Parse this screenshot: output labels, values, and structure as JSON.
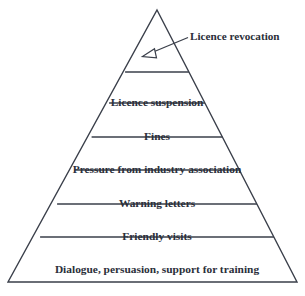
{
  "diagram": {
    "type": "enforcement-pyramid",
    "apex_callout": {
      "label": "Licence revocation",
      "icon": "arrow-icon",
      "arrow_style": "hollow-triangle-head",
      "points_to": "pyramid-apex"
    },
    "levels": [
      {
        "rank": 1,
        "label": "",
        "note": "apex band (unlabelled, target of callout)"
      },
      {
        "rank": 2,
        "label": "Licence suspension"
      },
      {
        "rank": 3,
        "label": "Fines"
      },
      {
        "rank": 4,
        "label": "Pressure from industry association"
      },
      {
        "rank": 5,
        "label": "Warning letters"
      },
      {
        "rank": 6,
        "label": "Friendly visits"
      },
      {
        "rank": 7,
        "label": "Dialogue, persuasion, support for training"
      }
    ],
    "colors": {
      "stroke": "#3a3f4a",
      "text": "#2b2f3a",
      "fill": "#ffffff",
      "background": "#ffffff"
    },
    "geometry": {
      "apex_x": 157,
      "apex_y": 10,
      "base_left_x": 8,
      "base_right_x": 297,
      "base_y": 282,
      "divider_y": [
        72,
        103,
        137,
        170,
        204,
        237
      ]
    }
  }
}
